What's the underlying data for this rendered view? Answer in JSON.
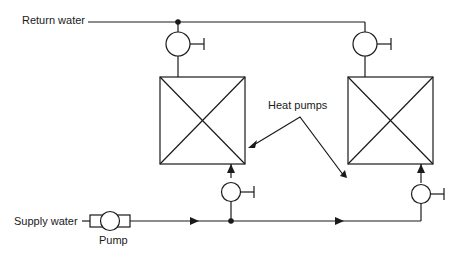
{
  "diagram": {
    "type": "piping-schematic",
    "labels": {
      "return_water": "Return water",
      "supply_water": "Supply water",
      "pump": "Pump",
      "heat_pumps": "Heat pumps"
    },
    "components": [
      {
        "id": "pump",
        "kind": "pump",
        "label": "Pump"
      },
      {
        "id": "hp1",
        "kind": "heat-pump",
        "label": "Heat pump 1"
      },
      {
        "id": "hp2",
        "kind": "heat-pump",
        "label": "Heat pump 2"
      },
      {
        "id": "v1",
        "kind": "valve",
        "position": "hp1-outlet"
      },
      {
        "id": "v2",
        "kind": "valve",
        "position": "hp2-outlet"
      },
      {
        "id": "v3",
        "kind": "valve",
        "position": "hp1-inlet"
      },
      {
        "id": "v4",
        "kind": "valve",
        "position": "hp2-inlet"
      }
    ],
    "colors": {
      "line": "#1a1a1a",
      "background": "#ffffff"
    }
  }
}
